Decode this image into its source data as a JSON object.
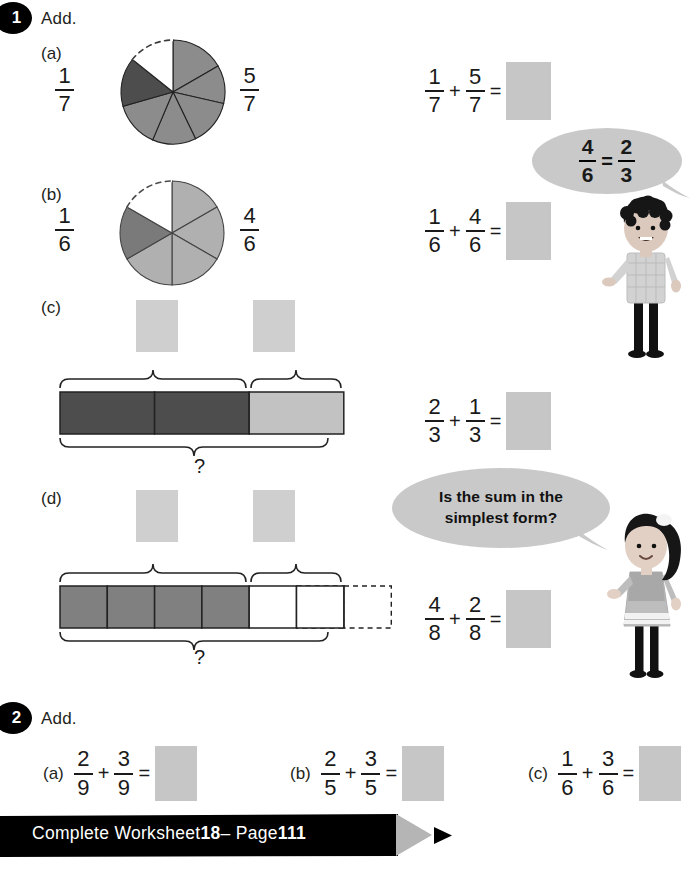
{
  "page": {
    "background": "#ffffff",
    "accent_dark": "#000000",
    "answer_box_color": "#c6c6c6",
    "bubble_color": "#c9c9c9"
  },
  "questions": [
    {
      "number": "1",
      "instruction": "Add.",
      "parts": [
        {
          "label": "(a)",
          "left_fraction": {
            "num": "1",
            "den": "7"
          },
          "right_fraction": {
            "num": "5",
            "den": "7"
          },
          "equation": {
            "a": {
              "num": "1",
              "den": "7"
            },
            "plus": "+",
            "b": {
              "num": "5",
              "den": "7"
            },
            "equals": "=",
            "answer": ""
          },
          "model": {
            "type": "pie",
            "total_parts": 7,
            "shaded_dark_parts": 1,
            "shaded_light_parts": 5,
            "unshaded_parts": 1,
            "dark_color": "#4d4d4d",
            "light_color": "#8c8c8c"
          }
        },
        {
          "label": "(b)",
          "left_fraction": {
            "num": "1",
            "den": "6"
          },
          "right_fraction": {
            "num": "4",
            "den": "6"
          },
          "equation": {
            "a": {
              "num": "1",
              "den": "6"
            },
            "plus": "+",
            "b": {
              "num": "4",
              "den": "6"
            },
            "equals": "=",
            "answer": ""
          },
          "model": {
            "type": "pie",
            "total_parts": 6,
            "shaded_dark_parts": 1,
            "shaded_light_parts": 4,
            "unshaded_parts": 1,
            "dark_color": "#7a7a7a",
            "light_color": "#b0b0b0"
          }
        },
        {
          "label": "(c)",
          "equation": {
            "a": {
              "num": "2",
              "den": "3"
            },
            "plus": "+",
            "b": {
              "num": "1",
              "den": "3"
            },
            "equals": "=",
            "answer": ""
          },
          "model": {
            "type": "bar",
            "total_cells": 3,
            "dark_cells": 2,
            "light_cells": 1,
            "dashed_cells": 0,
            "dark_color": "#4d4d4d",
            "light_color": "#c2c2c2",
            "whole_label": "?",
            "brace_labels": [
              "",
              ""
            ]
          }
        },
        {
          "label": "(d)",
          "equation": {
            "a": {
              "num": "4",
              "den": "8"
            },
            "plus": "+",
            "b": {
              "num": "2",
              "den": "8"
            },
            "equals": "=",
            "answer": ""
          },
          "model": {
            "type": "bar",
            "total_cells": 6,
            "dark_cells": 4,
            "light_cells": 2,
            "dashed_cells": 2,
            "dark_color": "#808080",
            "light_color": "#ffffff",
            "whole_label": "?",
            "brace_labels": [
              "",
              ""
            ]
          }
        }
      ]
    },
    {
      "number": "2",
      "instruction": "Add.",
      "parts": [
        {
          "label": "(a)",
          "equation": {
            "a": {
              "num": "2",
              "den": "9"
            },
            "plus": "+",
            "b": {
              "num": "3",
              "den": "9"
            },
            "equals": "=",
            "answer": ""
          }
        },
        {
          "label": "(b)",
          "equation": {
            "a": {
              "num": "2",
              "den": "5"
            },
            "plus": "+",
            "b": {
              "num": "3",
              "den": "5"
            },
            "equals": "=",
            "answer": ""
          }
        },
        {
          "label": "(c)",
          "equation": {
            "a": {
              "num": "1",
              "den": "6"
            },
            "plus": "+",
            "b": {
              "num": "3",
              "den": "6"
            },
            "equals": "=",
            "answer": ""
          }
        }
      ]
    }
  ],
  "speech_bubbles": [
    {
      "id": "boy-bubble",
      "type": "equation",
      "left": {
        "num": "4",
        "den": "6"
      },
      "equals": "=",
      "right": {
        "num": "2",
        "den": "3"
      }
    },
    {
      "id": "girl-bubble",
      "type": "text",
      "line1": "Is the sum in the",
      "line2": "simplest form?"
    }
  ],
  "characters": [
    {
      "id": "boy-character",
      "description": "boy"
    },
    {
      "id": "girl-character",
      "description": "girl"
    }
  ],
  "footer": {
    "prefix": "Complete Worksheet ",
    "worksheet_number": "18",
    "separator": " – Page ",
    "page_number": "111",
    "background": "#000000",
    "arrow_color": "#b5b5b5"
  }
}
